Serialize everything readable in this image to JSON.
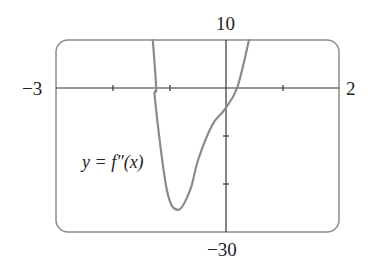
{
  "chart_data": {
    "type": "line",
    "title": "",
    "xlabel": "",
    "ylabel": "",
    "xlim": [
      -3,
      2
    ],
    "ylim": [
      -30,
      10
    ],
    "x_ticks": [
      -3,
      -2,
      -1,
      0,
      1,
      2
    ],
    "y_ticks": [
      10,
      0,
      -10,
      -20,
      -30
    ],
    "tick_labels": {
      "x_min": "−3",
      "x_max": "2",
      "y_max": "10",
      "y_min": "−30"
    },
    "grid": false,
    "legend": null,
    "annotations": [
      {
        "text": "y = f″(x)",
        "x": -2.4,
        "y": -15
      }
    ],
    "series": [
      {
        "name": "y = f″(x)",
        "x": [
          -1.29,
          -1.23,
          -1.25,
          -1.04,
          -0.84,
          -0.63,
          -0.49,
          -0.24,
          -0.03,
          0.2,
          0.41
        ],
        "y": [
          10,
          0,
          -2.5,
          -21.3,
          -25.4,
          -21.3,
          -15,
          -7.7,
          -4.6,
          0,
          10
        ]
      }
    ],
    "color": "#8a8a8a"
  },
  "labels": {
    "y_max": "10",
    "y_min": "−30",
    "x_min": "−3",
    "x_max": "2",
    "curve": "y = f″(x)"
  }
}
